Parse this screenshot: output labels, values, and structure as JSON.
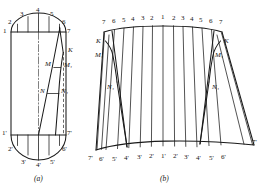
{
  "figure": {
    "captions": {
      "a": "(a)",
      "b": "(b)"
    },
    "colors": {
      "ink": "#1a1a1a",
      "paper": "#ffffff",
      "centerline": "#3a3a3a"
    }
  },
  "figure_a": {
    "name": "orthographic-projection",
    "top_labels": [
      "1",
      "2",
      "3",
      "4",
      "5",
      "6",
      "7"
    ],
    "bottom_labels": [
      "1'",
      "2'",
      "3'",
      "4'",
      "5'",
      "6'",
      "7'"
    ],
    "point_labels": [
      "K",
      "M",
      "M₁",
      "N",
      "N₁"
    ],
    "top_points": [
      {
        "label": "1",
        "x": 11,
        "y": 32
      },
      {
        "label": "2",
        "x": 15,
        "y": 24
      },
      {
        "label": "3",
        "x": 25,
        "y": 16
      },
      {
        "label": "4",
        "x": 39,
        "y": 13
      },
      {
        "label": "5",
        "x": 52,
        "y": 16
      },
      {
        "label": "6",
        "x": 62,
        "y": 24
      },
      {
        "label": "7",
        "x": 66,
        "y": 32
      }
    ],
    "bottom_points": [
      {
        "label": "1'",
        "x": 11,
        "y": 135
      },
      {
        "label": "2'",
        "x": 15,
        "y": 148
      },
      {
        "label": "3'",
        "x": 25,
        "y": 157
      },
      {
        "label": "4'",
        "x": 39,
        "y": 160
      },
      {
        "label": "5'",
        "x": 52,
        "y": 157
      },
      {
        "label": "6'",
        "x": 62,
        "y": 148
      },
      {
        "label": "7'",
        "x": 66,
        "y": 135
      }
    ],
    "marked_points": [
      {
        "label": "K",
        "x": 63,
        "y": 52
      },
      {
        "label": "M",
        "x": 50,
        "y": 66
      },
      {
        "label": "M₁",
        "x": 63,
        "y": 68
      },
      {
        "label": "N",
        "x": 45,
        "y": 93
      },
      {
        "label": "N₁",
        "x": 62,
        "y": 93
      }
    ]
  },
  "figure_b": {
    "name": "flat-development-pattern",
    "top_labels": [
      "7",
      "6",
      "5",
      "4",
      "3",
      "2",
      "1",
      "2",
      "3",
      "4",
      "5",
      "6",
      "7"
    ],
    "bottom_labels": [
      "7'",
      "6'",
      "5'",
      "4'",
      "3'",
      "2'",
      "1'",
      "2'",
      "3'",
      "4'",
      "5'",
      "6'",
      "7'"
    ],
    "point_labels_left": [
      "K",
      "M₁",
      "N₁"
    ],
    "point_labels_right": [
      "K",
      "M₁",
      "N₁"
    ],
    "dart_count": 2,
    "generatrix_count": 13
  }
}
